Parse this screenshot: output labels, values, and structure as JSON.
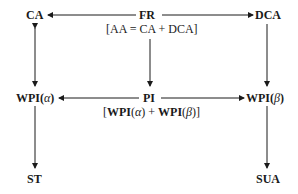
{
  "nodes": {
    "ca": "CA",
    "fr": "FR",
    "dca": "DCA",
    "wpi_alpha": "WPI",
    "wpi_alpha_sym": "α",
    "pi": "PI",
    "wpi_beta": "WPI",
    "wpi_beta_sym": "β",
    "st": "ST",
    "sua": "SUA"
  },
  "annotations": {
    "fr_note": "[AA = CA + DCA]",
    "pi_note_open": "[",
    "pi_note_wpi1": "WPI",
    "pi_note_alpha": "α",
    "pi_note_plus": " + ",
    "pi_note_wpi2": "WPI",
    "pi_note_beta": "β",
    "pi_note_close": "]"
  },
  "edges": [
    {
      "from": "FR",
      "to": "CA"
    },
    {
      "from": "FR",
      "to": "DCA"
    },
    {
      "from": "FR",
      "to": "PI"
    },
    {
      "from": "CA",
      "to": "WPI(α)",
      "bidirectional": true
    },
    {
      "from": "DCA",
      "to": "WPI(β)"
    },
    {
      "from": "PI",
      "to": "WPI(α)"
    },
    {
      "from": "PI",
      "to": "WPI(β)"
    },
    {
      "from": "WPI(α)",
      "to": "ST"
    },
    {
      "from": "WPI(β)",
      "to": "SUA"
    }
  ]
}
